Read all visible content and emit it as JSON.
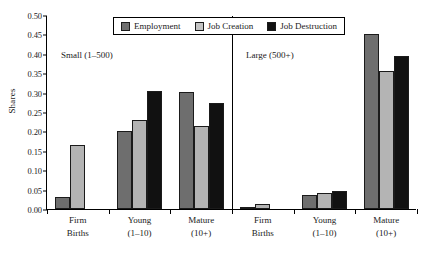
{
  "chart_data": {
    "type": "bar",
    "title": "",
    "xlabel": "",
    "ylabel": "Shares",
    "ylim": [
      0.0,
      0.5
    ],
    "ytick_labels": [
      "0.00",
      "0.05",
      "0.10",
      "0.15",
      "0.20",
      "0.25",
      "0.30",
      "0.35",
      "0.40",
      "0.45",
      "0.50"
    ],
    "ytick_values": [
      0.0,
      0.05,
      0.1,
      0.15,
      0.2,
      0.25,
      0.3,
      0.35,
      0.4,
      0.45,
      0.5
    ],
    "grid": false,
    "legend_position": "top-center",
    "series_names": [
      "Employment",
      "Job Creation",
      "Job Destruction"
    ],
    "series_colors": [
      "#6e6e6e",
      "#b4b4b4",
      "#111111"
    ],
    "panels": [
      {
        "name": "Small (1–500)",
        "categories": [
          "Firm Births",
          "Young (1–10)",
          "Mature (10+)"
        ],
        "category_lines": [
          [
            "Firm",
            "Births"
          ],
          [
            "Young",
            "(1–10)"
          ],
          [
            "Mature",
            "(10+)"
          ]
        ],
        "series": [
          {
            "name": "Employment",
            "values": [
              0.03,
              0.2,
              0.302
            ]
          },
          {
            "name": "Job Creation",
            "values": [
              0.165,
              0.23,
              0.215
            ]
          },
          {
            "name": "Job Destruction",
            "values": [
              0.0,
              0.305,
              0.272
            ]
          }
        ]
      },
      {
        "name": "Large (500+)",
        "categories": [
          "Firm Births",
          "Young (1–10)",
          "Mature (10+)"
        ],
        "category_lines": [
          [
            "Firm",
            "Births"
          ],
          [
            "Young",
            "(1–10)"
          ],
          [
            "Mature",
            "(10+)"
          ]
        ],
        "series": [
          {
            "name": "Employment",
            "values": [
              0.003,
              0.035,
              0.452
            ]
          },
          {
            "name": "Job Creation",
            "values": [
              0.013,
              0.042,
              0.355
            ]
          },
          {
            "name": "Job Destruction",
            "values": [
              0.0,
              0.046,
              0.394
            ]
          }
        ]
      }
    ]
  },
  "axis": {
    "y_title": "Shares"
  },
  "legend": {
    "items": [
      {
        "label": "Employment",
        "color": "#6e6e6e"
      },
      {
        "label": "Job Creation",
        "color": "#c4c4c4"
      },
      {
        "label": "Job Destruction",
        "color": "#111111"
      }
    ]
  }
}
